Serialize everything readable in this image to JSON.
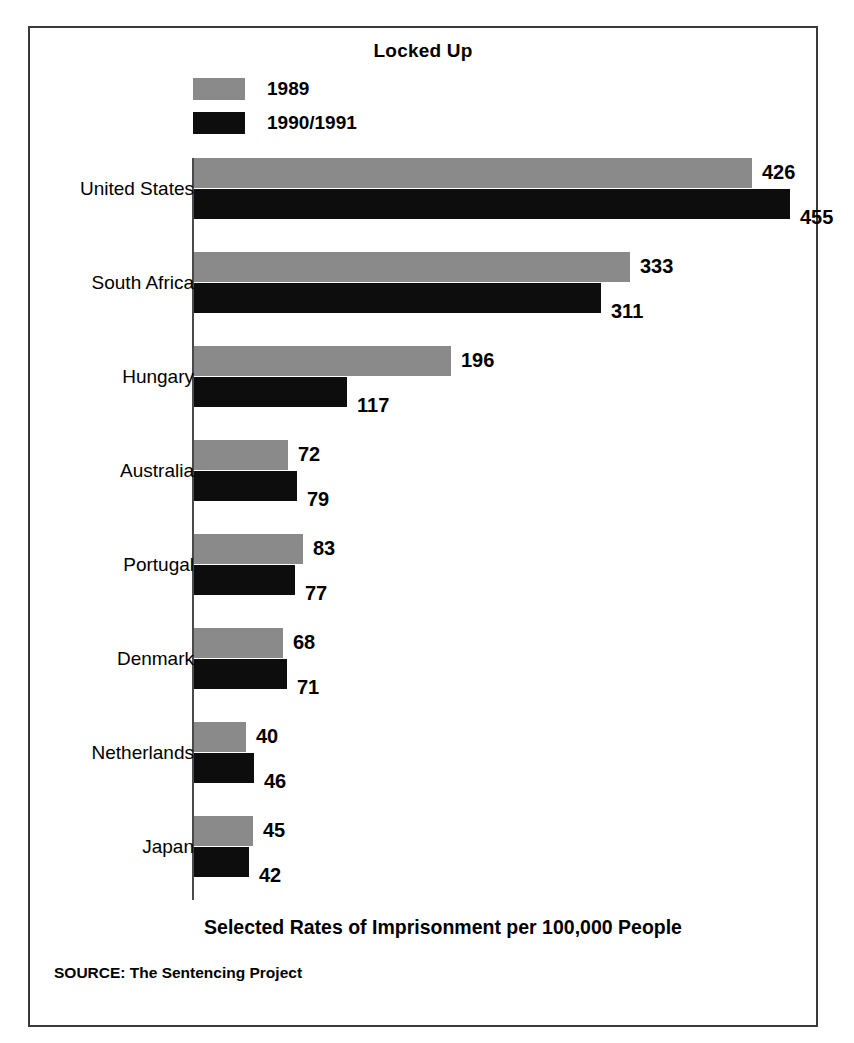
{
  "figure": {
    "title": "Locked Up",
    "axis_caption": "Selected Rates of Imprisonment per 100,000 People",
    "source_note": "SOURCE: The Sentencing Project"
  },
  "legend": {
    "items": [
      {
        "label": "1989",
        "color": "#8a8a8a",
        "swatch_name": "legend-swatch-1989"
      },
      {
        "label": "1990/1991",
        "color": "#0d0d0d",
        "swatch_name": "legend-swatch-1990-1991"
      }
    ]
  },
  "colors": {
    "series_1989": "#8a8a8a",
    "series_1990_1991": "#0d0d0d",
    "frame": "#3a3a3a",
    "axis": "#4a4a4a",
    "background": "#ffffff",
    "text": "#000000"
  },
  "chart_data": {
    "type": "bar",
    "orientation": "horizontal",
    "title": "Locked Up",
    "xlabel": "Selected Rates of Imprisonment per 100,000 People",
    "ylabel": "",
    "grid": false,
    "legend_position": "top-left",
    "xlim": [
      0,
      460
    ],
    "categories": [
      "United States",
      "South Africa",
      "Hungary",
      "Australia",
      "Portugal",
      "Denmark",
      "Netherlands",
      "Japan"
    ],
    "series": [
      {
        "name": "1989",
        "color": "#8a8a8a",
        "values": [
          426,
          333,
          196,
          72,
          83,
          68,
          40,
          45
        ]
      },
      {
        "name": "1990/1991",
        "color": "#0d0d0d",
        "values": [
          455,
          311,
          117,
          79,
          77,
          71,
          46,
          42
        ]
      }
    ]
  },
  "rows": [
    {
      "category": "United States",
      "v1989": "426",
      "v1990": "455",
      "w1989": 558,
      "w1990": 596
    },
    {
      "category": "South Africa",
      "v1989": "333",
      "v1990": "311",
      "w1989": 436,
      "w1990": 407
    },
    {
      "category": "Hungary",
      "v1989": "196",
      "v1990": "117",
      "w1989": 257,
      "w1990": 153
    },
    {
      "category": "Australia",
      "v1989": "72",
      "v1990": "79",
      "w1989": 94,
      "w1990": 103
    },
    {
      "category": "Portugal",
      "v1989": "83",
      "v1990": "77",
      "w1989": 109,
      "w1990": 101
    },
    {
      "category": "Denmark",
      "v1989": "68",
      "v1990": "71",
      "w1989": 89,
      "w1990": 93
    },
    {
      "category": "Netherlands",
      "v1989": "40",
      "v1990": "46",
      "w1989": 52,
      "w1990": 60
    },
    {
      "category": "Japan",
      "v1989": "45",
      "v1990": "42",
      "w1989": 59,
      "w1990": 55
    }
  ]
}
